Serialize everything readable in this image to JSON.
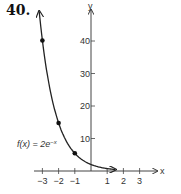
{
  "problem_number": "40.",
  "chart_data": {
    "type": "line",
    "title": "",
    "function_label": "f(x) = 2e^{-x}",
    "function_label_display": "f(x) = 2e",
    "function_label_exp": "−x",
    "xlabel": "x",
    "ylabel": "y",
    "x_ticks": [
      -3,
      -2,
      -1,
      1,
      2,
      3
    ],
    "x_tick_labels": [
      "−3",
      "−2",
      "−1",
      "1",
      "2",
      "3"
    ],
    "y_ticks": [
      10,
      20,
      30,
      40
    ],
    "y_tick_labels": [
      "10",
      "20",
      "30",
      "40"
    ],
    "xlim": [
      -3.5,
      4
    ],
    "ylim": [
      0,
      45
    ],
    "points": [
      {
        "x": -3,
        "y": 40.17
      },
      {
        "x": -2,
        "y": 14.78
      },
      {
        "x": -1,
        "y": 5.44
      }
    ],
    "series": [
      {
        "name": "f(x) = 2e^{-x}",
        "x": [
          -3.2,
          -3,
          -2.5,
          -2,
          -1.5,
          -1,
          -0.5,
          0,
          0.5,
          1,
          1.5
        ],
        "values": [
          49.07,
          40.17,
          24.36,
          14.78,
          8.96,
          5.44,
          3.3,
          2.0,
          1.21,
          0.74,
          0.45
        ]
      }
    ],
    "grid": false,
    "legend": "none"
  }
}
